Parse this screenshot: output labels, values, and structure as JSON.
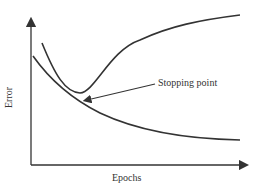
{
  "diagram": {
    "xlabel": "Epochs",
    "ylabel": "Error",
    "annotation": "Stopping point",
    "curves": [
      {
        "name": "training-error",
        "description": "monotonically decreasing"
      },
      {
        "name": "validation-error",
        "description": "decreases to a minimum then rises"
      }
    ],
    "stroke_color": "#333333"
  }
}
